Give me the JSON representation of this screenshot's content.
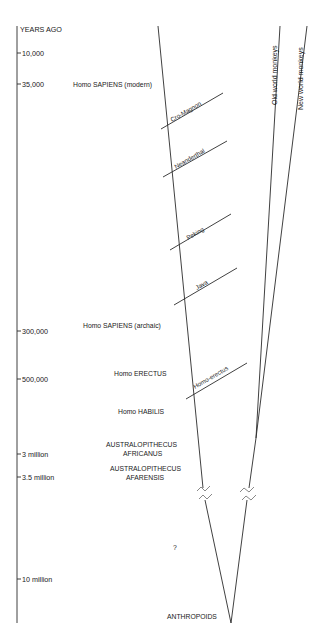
{
  "axis": {
    "title": "YEARS AGO",
    "ticks": [
      {
        "label": "10,000",
        "y": 53
      },
      {
        "label": "35,000",
        "y": 84
      },
      {
        "label": "300,000",
        "y": 331
      },
      {
        "label": "500,000",
        "y": 379
      },
      {
        "label": "3 million",
        "y": 454
      },
      {
        "label": "3.5 million",
        "y": 477
      },
      {
        "label": "10 million",
        "y": 579
      }
    ]
  },
  "species_labels": [
    {
      "id": "sapiens-modern",
      "text": "Homo SAPIENS (modern)",
      "x": 73,
      "y": 86
    },
    {
      "id": "sapiens-archaic",
      "text": "Homo SAPIENS (archaic)",
      "x": 83,
      "y": 327
    },
    {
      "id": "erectus",
      "text": "Homo ERECTUS",
      "x": 114,
      "y": 375
    },
    {
      "id": "habilis",
      "text": "Homo HABILIS",
      "x": 118,
      "y": 413
    },
    {
      "id": "africanus-1",
      "text": "AUSTRALOPITHECUS",
      "x": 106,
      "y": 446
    },
    {
      "id": "africanus-2",
      "text": "AFRICANUS",
      "x": 123,
      "y": 455
    },
    {
      "id": "afarensis-1",
      "text": "AUSTRALOPITHECUS",
      "x": 110,
      "y": 470
    },
    {
      "id": "afarensis-2",
      "text": "AFARENSIS",
      "x": 126,
      "y": 479
    },
    {
      "id": "unknown",
      "text": "?",
      "x": 173,
      "y": 550
    },
    {
      "id": "anthropoids",
      "text": "ANTHROPOIDS",
      "x": 167,
      "y": 618
    }
  ],
  "branches": [
    {
      "id": "cro-magnon",
      "label": "Cro-Magnon",
      "x1": 161,
      "y1": 129,
      "x2": 223,
      "y2": 93
    },
    {
      "id": "neanderthal",
      "label": "Neanderthal",
      "x1": 163,
      "y1": 177,
      "x2": 227,
      "y2": 141
    },
    {
      "id": "peking",
      "label": "Peking",
      "x1": 170,
      "y1": 250,
      "x2": 231,
      "y2": 214
    },
    {
      "id": "java",
      "label": "Java",
      "x1": 174,
      "y1": 305,
      "x2": 237,
      "y2": 268
    },
    {
      "id": "homo-erectus",
      "label": "Homo-erectus",
      "x1": 186,
      "y1": 399,
      "x2": 247,
      "y2": 363
    }
  ],
  "lineages": [
    {
      "id": "old-world-monkeys",
      "label": "Old world monkeys"
    },
    {
      "id": "new-world-monkeys",
      "label": "New world monkeys"
    }
  ]
}
